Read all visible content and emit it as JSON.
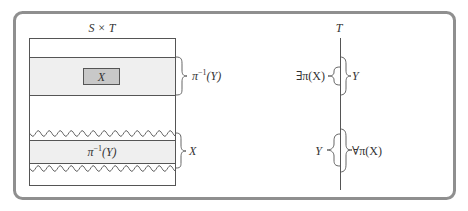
{
  "diagram": {
    "colors": {
      "frame": "#8f8f8f",
      "line": "#555555",
      "band_fill": "#efefef",
      "x_box_fill": "#c8c8c8",
      "text": "#333333"
    },
    "left_panel": {
      "title": "S × T",
      "top_band": {
        "inner_box_label": "X",
        "brace_label_base": "π",
        "brace_label_sup": "−1",
        "brace_label_arg": "(Y)"
      },
      "bottom_band": {
        "inner_label_base": "π",
        "inner_label_sup": "−1",
        "inner_label_arg": "(Y)",
        "brace_label": "X"
      }
    },
    "right_panel": {
      "axis_label": "T",
      "top_group": {
        "left_brace_label": "∃π(X)",
        "right_brace_label": "Y"
      },
      "bottom_group": {
        "left_brace_label": "Y",
        "right_brace_label": "∀π(X)"
      }
    }
  }
}
